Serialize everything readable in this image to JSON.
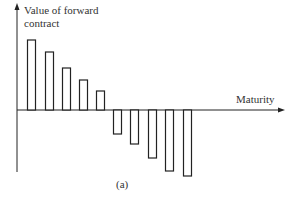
{
  "chart_data": {
    "type": "bar",
    "title": "",
    "xlabel": "Maturity",
    "ylabel": "Value of forward contract",
    "caption": "(a)",
    "grid": false,
    "legend": null,
    "ylabel_lines": [
      "Value of forward",
      "contract"
    ],
    "categories": [
      1,
      2,
      3,
      4,
      5,
      6,
      7,
      8,
      9,
      10
    ],
    "values": [
      70,
      58,
      42,
      30,
      19,
      -24,
      -34,
      -48,
      -61,
      -66
    ],
    "units": "relative (schematic, no numeric scale shown)",
    "colors": {
      "bar_stroke": "#222222",
      "bar_fill": "#ffffff",
      "axis": "#222222"
    },
    "layout": {
      "axis_x0": 17,
      "axis_y0": 110,
      "axis_x_end": 285,
      "axis_y_top": 3,
      "axis_y_bottom": 172,
      "bar_width": 9,
      "bar_x": [
        27,
        45,
        62,
        79,
        96,
        113,
        130,
        148,
        165,
        183
      ]
    }
  }
}
